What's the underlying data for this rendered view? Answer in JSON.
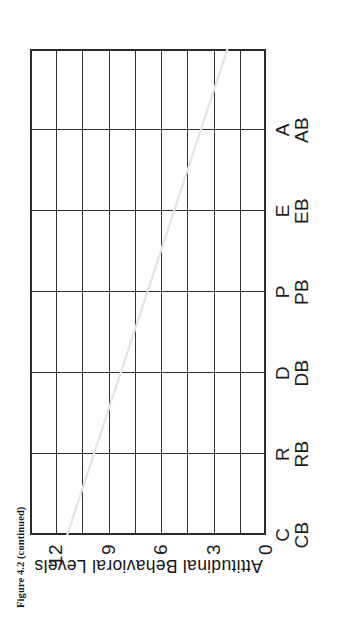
{
  "caption": {
    "text": "Figure 4.2 (continued)"
  },
  "chart_data": {
    "type": "bar",
    "title": "",
    "subtitle": "",
    "xlabel": "",
    "ylabel": "Attitudinal Behavioral Levels",
    "categories": [
      "C",
      "R",
      "D",
      "P",
      "E",
      "A"
    ],
    "category_codes": [
      "CB",
      "RB",
      "DB",
      "PB",
      "EB",
      "AB"
    ],
    "values": [
      null,
      null,
      null,
      null,
      null,
      null
    ],
    "ylim": [
      0,
      13.5
    ],
    "yticks": [
      0,
      3,
      6,
      9,
      12
    ],
    "ytick_labels": [
      "0",
      "3",
      "6",
      "9",
      "12"
    ],
    "gridlines": {
      "horizontal_count": 9,
      "vertical_count": 7,
      "grid": true
    },
    "legend": {
      "entries": [],
      "position": "none"
    },
    "annotations": [],
    "note": "Empty plotting grid — no data series plotted; blank worksheet-style chart."
  },
  "artifacts": {
    "crease_label": "scan-crease-line",
    "crease_color": "#e2e2e2"
  },
  "colors": {
    "ink": "#1c1c1c",
    "frame": "#2b2b2b",
    "grid": "#333333",
    "paper": "#ffffff"
  }
}
